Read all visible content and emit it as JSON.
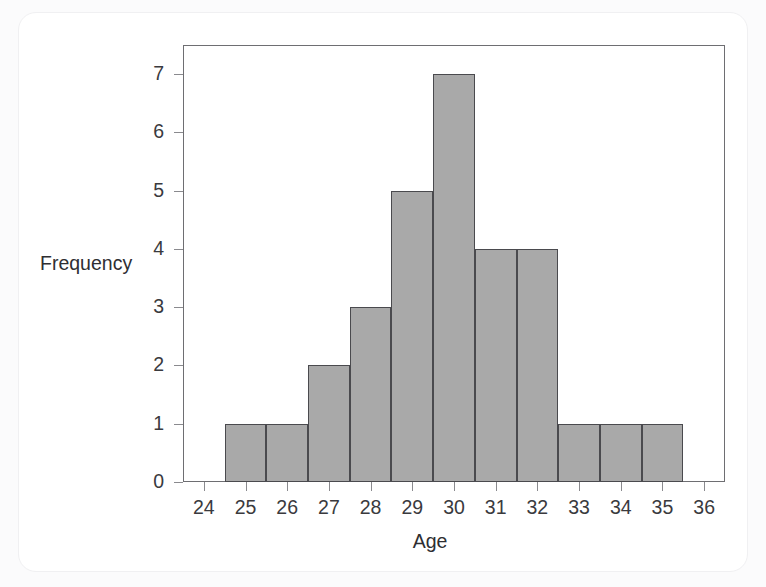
{
  "chart_data": {
    "type": "bar",
    "title": "",
    "subtitle": "",
    "xlabel": "Age",
    "ylabel": "Frequency",
    "categories": [
      25,
      26,
      27,
      28,
      29,
      30,
      31,
      32,
      33,
      34,
      35
    ],
    "values": [
      1,
      1,
      2,
      3,
      5,
      7,
      4,
      4,
      1,
      1,
      1
    ],
    "bin_width": 1,
    "bin_edges": [
      24.5,
      25.5,
      26.5,
      27.5,
      28.5,
      29.5,
      30.5,
      31.5,
      32.5,
      33.5,
      34.5,
      35.5
    ],
    "bars": [
      {
        "center": 25,
        "low": 24.5,
        "high": 25.5,
        "frequency": 1
      },
      {
        "center": 26,
        "low": 25.5,
        "high": 26.5,
        "frequency": 1
      },
      {
        "center": 27,
        "low": 26.5,
        "high": 27.5,
        "frequency": 2
      },
      {
        "center": 28,
        "low": 27.5,
        "high": 28.5,
        "frequency": 3
      },
      {
        "center": 29,
        "low": 28.5,
        "high": 29.5,
        "frequency": 5
      },
      {
        "center": 30,
        "low": 29.5,
        "high": 30.5,
        "frequency": 7
      },
      {
        "center": 31,
        "low": 30.5,
        "high": 31.5,
        "frequency": 4
      },
      {
        "center": 32,
        "low": 31.5,
        "high": 32.5,
        "frequency": 4
      },
      {
        "center": 33,
        "low": 32.5,
        "high": 33.5,
        "frequency": 1
      },
      {
        "center": 34,
        "low": 33.5,
        "high": 34.5,
        "frequency": 1
      },
      {
        "center": 35,
        "low": 34.5,
        "high": 35.5,
        "frequency": 1
      }
    ],
    "xlim": [
      23.5,
      36.5
    ],
    "ylim": [
      0,
      7.5
    ],
    "xticks": [
      24,
      25,
      26,
      27,
      28,
      29,
      30,
      31,
      32,
      33,
      34,
      35,
      36
    ],
    "xtick_labels": [
      "24",
      "25",
      "26",
      "27",
      "28",
      "29",
      "30",
      "31",
      "32",
      "33",
      "34",
      "35",
      "36"
    ],
    "yticks": [
      0,
      1,
      2,
      3,
      4,
      5,
      6,
      7
    ],
    "ytick_labels": [
      "0",
      "1",
      "2",
      "3",
      "4",
      "5",
      "6",
      "7"
    ],
    "grid": false,
    "legend": null,
    "annotations": [],
    "colors": {
      "bar_fill": "#a9a9a9",
      "bar_edge": "#4a4a4e",
      "axis": "#6e6e72",
      "tick": "#8a8a8e",
      "text": "#3a3a3e",
      "plot_background": "#ffffff",
      "card_background": "#ffffff",
      "page_background": "#fbfbfc"
    }
  }
}
